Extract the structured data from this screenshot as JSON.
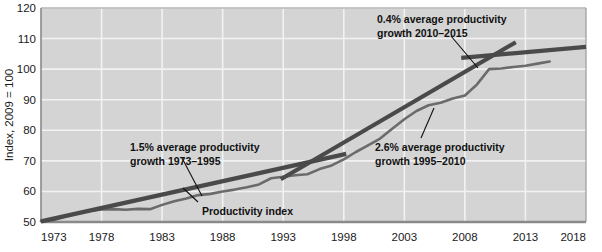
{
  "chart_data": {
    "type": "line",
    "title": "",
    "xlabel": "",
    "ylabel": "Index, 2009 = 100",
    "xlim": [
      1973,
      2018
    ],
    "ylim": [
      50,
      120
    ],
    "xticks": [
      "1973",
      "1978",
      "1983",
      "1988",
      "1993",
      "1998",
      "2003",
      "2008",
      "2013",
      "2018"
    ],
    "yticks": [
      "50",
      "60",
      "70",
      "80",
      "90",
      "100",
      "110",
      "120"
    ],
    "grid": true,
    "legend_position": "inline-annotation",
    "series": [
      {
        "name": "Productivity index",
        "color": "#6b6b6b",
        "x": [
          1973,
          1974,
          1975,
          1976,
          1977,
          1978,
          1979,
          1980,
          1981,
          1982,
          1983,
          1984,
          1985,
          1986,
          1987,
          1988,
          1989,
          1990,
          1991,
          1992,
          1993,
          1994,
          1995,
          1996,
          1997,
          1998,
          1999,
          2000,
          2001,
          2002,
          2003,
          2004,
          2005,
          2006,
          2007,
          2008,
          2009,
          2010,
          2011,
          2012,
          2013,
          2014,
          2015
        ],
        "values": [
          50.3,
          50.6,
          51.8,
          52.9,
          53.6,
          54.1,
          54.2,
          54.0,
          54.3,
          54.2,
          55.6,
          56.8,
          57.7,
          58.8,
          59.2,
          60.0,
          60.6,
          61.4,
          62.3,
          64.3,
          64.8,
          65.3,
          65.6,
          67.3,
          68.5,
          70.5,
          72.9,
          75.1,
          77.3,
          80.5,
          83.6,
          86.3,
          88.2,
          89.0,
          90.4,
          91.4,
          95.0,
          100.0,
          100.2,
          100.7,
          101.1,
          101.8,
          102.5
        ]
      }
    ],
    "trend_lines": [
      {
        "name": "trend-1973-1995",
        "color": "#4a4a4a",
        "x_start": 1973,
        "x_end": 1998.2,
        "y_start": 50.2,
        "y_end": 72.3,
        "rate_percent": 1.5,
        "period": "1973–1995"
      },
      {
        "name": "trend-1995-2010",
        "color": "#4a4a4a",
        "x_start": 1992.8,
        "x_end": 2012.2,
        "y_start": 64.0,
        "y_end": 108.8,
        "rate_percent": 2.6,
        "period": "1995–2010"
      },
      {
        "name": "trend-2010-2015",
        "color": "#4a4a4a",
        "x_start": 2007.7,
        "x_end": 2018.0,
        "y_start": 103.7,
        "y_end": 107.3,
        "rate_percent": 0.4,
        "period": "2010–2015"
      }
    ],
    "annotations": [
      {
        "name": "annotation-1973-1995",
        "line1": "1.5% average productivity",
        "line2": "growth 1973–1995",
        "text_x": 130,
        "text_y": 142,
        "leader": [
          182,
          158,
          202,
          196
        ]
      },
      {
        "name": "annotation-1995-2010",
        "line1": "2.6% average productivity",
        "line2": "growth 1995–2010",
        "text_x": 375,
        "text_y": 142,
        "leader": [
          421,
          138,
          434,
          108
        ]
      },
      {
        "name": "annotation-2010-2015",
        "line1": "0.4% average productivity",
        "line2": "growth 2010–2015",
        "text_x": 377,
        "text_y": 14,
        "leader": [
          451,
          36,
          478,
          68
        ]
      },
      {
        "name": "annotation-productivity-index",
        "line1": "Productivity index",
        "line2": "",
        "text_x": 202,
        "text_y": 206,
        "leader": [
          198,
          202,
          183,
          188
        ]
      }
    ]
  },
  "colors": {
    "plot_background": "#d4d4d4",
    "grid": "#f2f2f2",
    "axis": "#8a8a8a",
    "series": "#6b6b6b",
    "trend": "#4a4a4a",
    "text": "#111111"
  }
}
